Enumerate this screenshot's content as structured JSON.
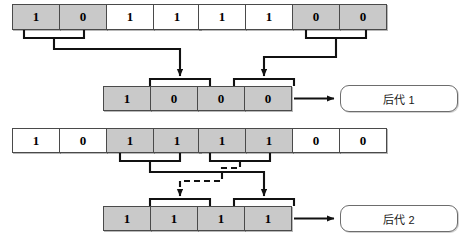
{
  "diagram": {
    "type": "genetic-algorithm-crossover",
    "colors": {
      "selected_gene": "#c9c9c9",
      "unselected_gene": "#ffffff",
      "line": "#111111",
      "cell_border": "#4a4a4a",
      "box_border": "#6d6d6d"
    }
  },
  "rows": {
    "parent1": {
      "name": "parent-1",
      "genes": [
        {
          "value": "1",
          "shaded": true
        },
        {
          "value": "0",
          "shaded": true
        },
        {
          "value": "1",
          "shaded": false
        },
        {
          "value": "1",
          "shaded": false
        }
      ]
    },
    "parent2": {
      "name": "parent-2",
      "genes": [
        {
          "value": "1",
          "shaded": false
        },
        {
          "value": "1",
          "shaded": false
        },
        {
          "value": "0",
          "shaded": true
        },
        {
          "value": "0",
          "shaded": true
        }
      ]
    },
    "offspring1": {
      "name": "offspring-1",
      "genes": [
        {
          "value": "1",
          "shaded": true
        },
        {
          "value": "0",
          "shaded": true
        },
        {
          "value": "0",
          "shaded": true
        },
        {
          "value": "0",
          "shaded": true
        }
      ]
    },
    "parent3": {
      "name": "parent-3",
      "genes": [
        {
          "value": "1",
          "shaded": false
        },
        {
          "value": "0",
          "shaded": false
        },
        {
          "value": "1",
          "shaded": true
        },
        {
          "value": "1",
          "shaded": true
        }
      ]
    },
    "parent4": {
      "name": "parent-4",
      "genes": [
        {
          "value": "1",
          "shaded": true
        },
        {
          "value": "1",
          "shaded": true
        },
        {
          "value": "0",
          "shaded": false
        },
        {
          "value": "0",
          "shaded": false
        }
      ]
    },
    "offspring2": {
      "name": "offspring-2",
      "genes": [
        {
          "value": "1",
          "shaded": true
        },
        {
          "value": "1",
          "shaded": true
        },
        {
          "value": "1",
          "shaded": true
        },
        {
          "value": "1",
          "shaded": true
        }
      ]
    }
  },
  "labels": {
    "offspring1_box": "后代 1",
    "offspring2_box": "后代 2"
  }
}
